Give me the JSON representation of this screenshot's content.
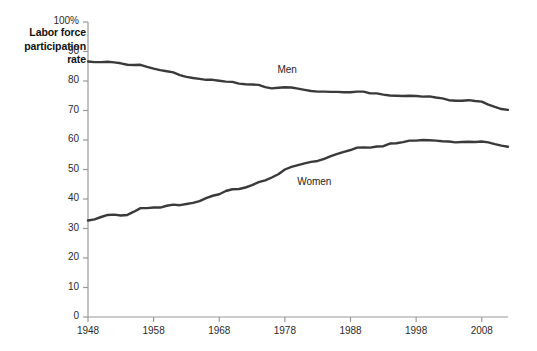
{
  "chart_data": {
    "type": "line",
    "title": "Labor force participation rate",
    "xlabel": "",
    "ylabel": "Labor force participation rate",
    "grid": false,
    "legend_position": "inline-series-labels",
    "xlim": [
      1948,
      2012
    ],
    "ylim": [
      0,
      100
    ],
    "y_ticks": [
      "0",
      "10",
      "20",
      "30",
      "40",
      "50",
      "60",
      "70",
      "80",
      "90",
      "100%"
    ],
    "y_tick_values": [
      0,
      10,
      20,
      30,
      40,
      50,
      60,
      70,
      80,
      90,
      100
    ],
    "x_ticks": [
      "1948",
      "1958",
      "1968",
      "1978",
      "1988",
      "1998",
      "2008"
    ],
    "x_tick_values": [
      1948,
      1958,
      1968,
      1978,
      1988,
      1998,
      2008
    ],
    "x": [
      1948,
      1949,
      1950,
      1951,
      1952,
      1953,
      1954,
      1955,
      1956,
      1957,
      1958,
      1959,
      1960,
      1961,
      1962,
      1963,
      1964,
      1965,
      1966,
      1967,
      1968,
      1969,
      1970,
      1971,
      1972,
      1973,
      1974,
      1975,
      1976,
      1977,
      1978,
      1979,
      1980,
      1981,
      1982,
      1983,
      1984,
      1985,
      1986,
      1987,
      1988,
      1989,
      1990,
      1991,
      1992,
      1993,
      1994,
      1995,
      1996,
      1997,
      1998,
      1999,
      2000,
      2001,
      2002,
      2003,
      2004,
      2005,
      2006,
      2007,
      2008,
      2009,
      2010,
      2011,
      2012
    ],
    "series": [
      {
        "name": "Men",
        "label": "Men",
        "color": "#3a3a3a",
        "values": [
          86.6,
          86.4,
          86.4,
          86.5,
          86.3,
          86.0,
          85.5,
          85.4,
          85.5,
          84.8,
          84.2,
          83.7,
          83.3,
          82.9,
          82.0,
          81.4,
          81.0,
          80.7,
          80.4,
          80.4,
          80.1,
          79.8,
          79.7,
          79.1,
          78.9,
          78.8,
          78.7,
          77.9,
          77.5,
          77.7,
          77.9,
          77.8,
          77.4,
          77.0,
          76.6,
          76.4,
          76.4,
          76.3,
          76.3,
          76.2,
          76.2,
          76.4,
          76.4,
          75.8,
          75.8,
          75.4,
          75.1,
          75.0,
          74.9,
          75.0,
          74.9,
          74.7,
          74.8,
          74.4,
          74.1,
          73.5,
          73.3,
          73.3,
          73.5,
          73.2,
          73.0,
          72.0,
          71.2,
          70.5,
          70.2
        ]
      },
      {
        "name": "Women",
        "label": "Women",
        "color": "#3a3a3a",
        "values": [
          32.7,
          33.1,
          33.9,
          34.6,
          34.7,
          34.4,
          34.6,
          35.7,
          36.9,
          36.9,
          37.1,
          37.1,
          37.7,
          38.1,
          37.9,
          38.3,
          38.7,
          39.3,
          40.3,
          41.1,
          41.6,
          42.7,
          43.3,
          43.4,
          43.9,
          44.7,
          45.7,
          46.3,
          47.3,
          48.4,
          50.0,
          50.9,
          51.5,
          52.1,
          52.6,
          52.9,
          53.6,
          54.5,
          55.3,
          56.0,
          56.6,
          57.4,
          57.5,
          57.4,
          57.8,
          57.9,
          58.8,
          58.9,
          59.3,
          59.8,
          59.8,
          60.0,
          59.9,
          59.8,
          59.6,
          59.5,
          59.2,
          59.3,
          59.4,
          59.3,
          59.5,
          59.2,
          58.6,
          58.1,
          57.7
        ]
      }
    ],
    "annotations": [
      {
        "text": "Men",
        "x": 1979,
        "y": 83.5
      },
      {
        "text": "Women",
        "x": 1982,
        "y": 45.5
      }
    ],
    "axis_color": "#9a9a9a",
    "line_color": "#3a3a3a",
    "background": "#ffffff"
  }
}
